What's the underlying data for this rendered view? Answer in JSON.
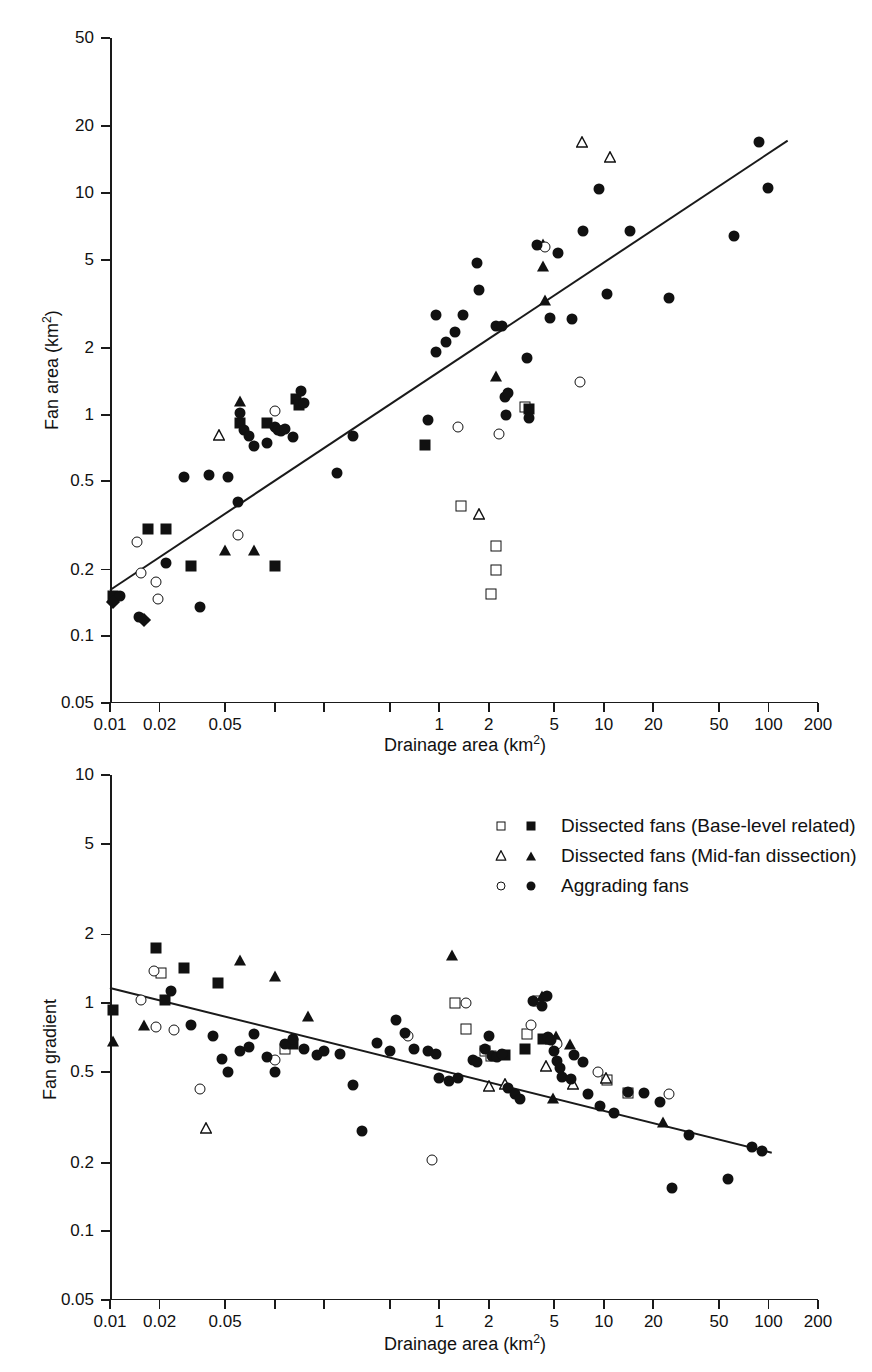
{
  "figure": {
    "background": "#ffffff",
    "ink_color": "#111111"
  },
  "chart_data": [
    {
      "id": "top-panel",
      "type": "scatter",
      "title": "",
      "xlabel": "Drainage area (km2)",
      "xlabel_base": "Drainage area (km",
      "xlabel_sup": "2",
      "xlabel_tail": ")",
      "ylabel": "Fan area (km2)",
      "ylabel_base": "Fan area (km",
      "ylabel_sup": "2",
      "ylabel_tail": ")",
      "xscale": "log",
      "yscale": "log",
      "xlim": [
        0.01,
        200
      ],
      "ylim": [
        0.05,
        50
      ],
      "grid": false,
      "xticks": [
        0.01,
        0.02,
        0.05,
        0.1,
        0.2,
        0.5,
        1,
        2,
        5,
        10,
        20,
        50,
        100,
        200
      ],
      "xticklabels": [
        "0.01",
        "0.02",
        "0.05",
        "1",
        "2",
        "5",
        "10",
        "20",
        "50",
        "100",
        "200"
      ],
      "xticklabel_values": [
        0.01,
        0.02,
        0.05,
        0.1,
        0.2,
        0.5,
        1,
        2,
        5,
        10,
        20,
        50,
        100,
        200
      ],
      "xticklabels_shown": [
        "0.01",
        "0.02",
        "0.05",
        "",
        "",
        "",
        "1",
        "2",
        "5",
        "10",
        "20",
        "50",
        "100",
        "200"
      ],
      "yticks": [
        0.05,
        0.1,
        0.2,
        0.5,
        1,
        2,
        5,
        10,
        20,
        50
      ],
      "yticklabels": [
        "0.05",
        "0.1",
        "0.2",
        "0.5",
        "1",
        "2",
        "5",
        "10",
        "20",
        "50"
      ],
      "fit_line": {
        "x0": 0.01,
        "y0": 0.162,
        "x1": 130.0,
        "y1": 17.2
      },
      "series": [
        {
          "name": "Dissected fans (Base-level related) open",
          "marker": "square-open",
          "points": [
            [
              1.35,
              0.385
            ],
            [
              2.2,
              0.255
            ],
            [
              2.2,
              0.2
            ],
            [
              2.05,
              0.155
            ],
            [
              3.3,
              1.08
            ]
          ]
        },
        {
          "name": "Dissected fans (Base-level related) filled",
          "marker": "square-filled",
          "points": [
            [
              0.0105,
              0.152
            ],
            [
              0.017,
              0.305
            ],
            [
              0.022,
              0.305
            ],
            [
              0.031,
              0.208
            ],
            [
              0.062,
              0.92
            ],
            [
              0.09,
              0.92
            ],
            [
              0.1,
              0.208
            ],
            [
              0.135,
              1.18
            ],
            [
              0.14,
              1.1
            ],
            [
              0.82,
              0.73
            ],
            [
              3.5,
              1.06
            ]
          ]
        },
        {
          "name": "Dissected fans (Mid-fan dissection) open",
          "marker": "triangle-open",
          "points": [
            [
              0.042,
              0.86
            ],
            [
              1.6,
              0.38
            ],
            [
              6.8,
              18.0
            ],
            [
              10.0,
              15.5
            ]
          ]
        },
        {
          "name": "Dissected fans (Mid-fan dissection) filled",
          "marker": "triangle-filled",
          "points": [
            [
              0.05,
              0.245
            ],
            [
              0.075,
              0.245
            ],
            [
              0.062,
              1.15
            ],
            [
              2.2,
              1.5
            ],
            [
              4.3,
              5.9
            ],
            [
              4.3,
              4.7
            ],
            [
              4.4,
              3.3
            ]
          ]
        },
        {
          "name": "Aggrading fans open",
          "marker": "circle-open",
          "points": [
            [
              0.0145,
              0.265
            ],
            [
              0.0155,
              0.193
            ],
            [
              0.019,
              0.175
            ],
            [
              0.0195,
              0.148
            ],
            [
              0.06,
              0.285
            ],
            [
              0.1,
              1.04
            ],
            [
              1.3,
              0.88
            ],
            [
              2.3,
              0.82
            ],
            [
              4.4,
              5.7
            ],
            [
              7.2,
              1.4
            ]
          ]
        },
        {
          "name": "Aggrading fans filled",
          "marker": "circle-filled",
          "points": [
            [
              0.0115,
              0.152
            ],
            [
              0.015,
              0.122
            ],
            [
              0.022,
              0.215
            ],
            [
              0.035,
              0.135
            ],
            [
              0.028,
              0.525
            ],
            [
              0.04,
              0.535
            ],
            [
              0.052,
              0.525
            ],
            [
              0.06,
              0.405
            ],
            [
              0.062,
              1.02
            ],
            [
              0.065,
              0.85
            ],
            [
              0.07,
              0.8
            ],
            [
              0.075,
              0.72
            ],
            [
              0.09,
              0.745
            ],
            [
              0.1,
              0.88
            ],
            [
              0.105,
              0.85
            ],
            [
              0.11,
              0.84
            ],
            [
              0.115,
              0.86
            ],
            [
              0.13,
              0.79
            ],
            [
              0.145,
              1.28
            ],
            [
              0.15,
              1.13
            ],
            [
              0.24,
              0.545
            ],
            [
              0.3,
              0.8
            ],
            [
              0.85,
              0.95
            ],
            [
              0.95,
              2.82
            ],
            [
              0.95,
              1.92
            ],
            [
              1.1,
              2.12
            ],
            [
              1.25,
              2.35
            ],
            [
              1.4,
              2.82
            ],
            [
              1.7,
              4.85
            ],
            [
              1.75,
              3.65
            ],
            [
              2.2,
              2.5
            ],
            [
              2.4,
              2.5
            ],
            [
              2.5,
              1.2
            ],
            [
              2.55,
              1.0
            ],
            [
              2.6,
              1.25
            ],
            [
              3.4,
              1.8
            ],
            [
              3.5,
              0.97
            ],
            [
              3.9,
              5.8
            ],
            [
              4.7,
              2.72
            ],
            [
              5.3,
              5.35
            ],
            [
              6.4,
              2.7
            ],
            [
              7.5,
              6.7
            ],
            [
              9.3,
              10.4
            ],
            [
              10.5,
              3.5
            ],
            [
              14.5,
              6.7
            ],
            [
              25.0,
              3.35
            ],
            [
              62.0,
              6.4
            ],
            [
              88.0,
              17.0
            ],
            [
              100.0,
              10.5
            ]
          ]
        },
        {
          "name": "Diamond markers",
          "marker": "diamond-filled",
          "points": [
            [
              0.0105,
              0.143
            ],
            [
              0.016,
              0.118
            ]
          ]
        }
      ]
    },
    {
      "id": "bottom-panel",
      "type": "scatter",
      "title": "",
      "xlabel": "Drainage area (km2)",
      "xlabel_base": "Drainage area (km",
      "xlabel_sup": "2",
      "xlabel_tail": ")",
      "ylabel": "Fan gradient",
      "xscale": "log",
      "yscale": "log",
      "xlim": [
        0.01,
        200
      ],
      "ylim": [
        0.05,
        10
      ],
      "grid": false,
      "xticks": [
        0.01,
        0.02,
        0.05,
        0.1,
        0.2,
        0.5,
        1,
        2,
        5,
        10,
        20,
        50,
        100,
        200
      ],
      "xticklabels_shown": [
        "0.01",
        "0.02",
        "0.05",
        "",
        "",
        "",
        "1",
        "2",
        "5",
        "10",
        "20",
        "50",
        "100",
        "200"
      ],
      "yticks": [
        0.05,
        0.1,
        0.2,
        0.5,
        1,
        2,
        5,
        10
      ],
      "yticklabels": [
        "0.05",
        "0.1",
        "0.2",
        "0.5",
        "1",
        "2",
        "5",
        "10"
      ],
      "fit_line": {
        "x0": 0.01,
        "y0": 1.17,
        "x1": 105.0,
        "y1": 0.222
      },
      "series": [
        {
          "name": "Dissected fans (Base-level related) open",
          "marker": "square-open",
          "points": [
            [
              0.0205,
              1.36
            ],
            [
              0.115,
              0.63
            ],
            [
              1.25,
              1.0
            ],
            [
              1.45,
              0.77
            ],
            [
              1.9,
              0.62
            ],
            [
              2.05,
              0.585
            ],
            [
              3.4,
              0.735
            ],
            [
              4.0,
              1.02
            ],
            [
              10.5,
              0.46
            ],
            [
              14.0,
              0.405
            ]
          ]
        },
        {
          "name": "Dissected fans (Base-level related) filled",
          "marker": "square-filled",
          "points": [
            [
              0.0105,
              0.935
            ],
            [
              0.019,
              1.75
            ],
            [
              0.0215,
              1.03
            ],
            [
              0.028,
              1.43
            ],
            [
              0.045,
              1.22
            ],
            [
              0.13,
              0.66
            ],
            [
              2.5,
              0.59
            ],
            [
              3.3,
              0.63
            ],
            [
              4.3,
              0.7
            ]
          ]
        },
        {
          "name": "Dissected fans (Mid-fan dissection) open",
          "marker": "triangle-open",
          "points": [
            [
              0.035,
              0.3
            ],
            [
              1.85,
              0.46
            ],
            [
              2.3,
              0.47
            ],
            [
              4.1,
              0.565
            ],
            [
              6.0,
              0.47
            ],
            [
              9.5,
              0.5
            ]
          ]
        },
        {
          "name": "Dissected fans (Mid-fan dissection) filled",
          "marker": "triangle-filled",
          "points": [
            [
              0.0105,
              0.68
            ],
            [
              0.016,
              0.8
            ],
            [
              0.062,
              1.55
            ],
            [
              0.1,
              1.32
            ],
            [
              0.16,
              0.88
            ],
            [
              1.2,
              1.62
            ],
            [
              4.2,
              1.07
            ],
            [
              4.8,
              0.7
            ],
            [
              4.9,
              0.385
            ],
            [
              5.1,
              0.72
            ],
            [
              6.2,
              0.66
            ],
            [
              23.0,
              0.3
            ]
          ]
        },
        {
          "name": "Aggrading fans open",
          "marker": "circle-open",
          "points": [
            [
              0.0155,
              1.03
            ],
            [
              0.0185,
              1.38
            ],
            [
              0.019,
              0.79
            ],
            [
              0.0245,
              0.76
            ],
            [
              0.035,
              0.42
            ],
            [
              0.1,
              0.565
            ],
            [
              0.65,
              0.72
            ],
            [
              0.9,
              0.205
            ],
            [
              1.45,
              1.0
            ],
            [
              3.6,
              0.8
            ],
            [
              5.2,
              0.66
            ],
            [
              9.2,
              0.5
            ],
            [
              25.0,
              0.4
            ]
          ]
        },
        {
          "name": "Aggrading fans filled",
          "marker": "circle-filled",
          "points": [
            [
              0.0235,
              1.13
            ],
            [
              0.031,
              0.8
            ],
            [
              0.042,
              0.72
            ],
            [
              0.048,
              0.57
            ],
            [
              0.052,
              0.5
            ],
            [
              0.062,
              0.62
            ],
            [
              0.07,
              0.64
            ],
            [
              0.075,
              0.73
            ],
            [
              0.09,
              0.58
            ],
            [
              0.1,
              0.5
            ],
            [
              0.115,
              0.66
            ],
            [
              0.13,
              0.7
            ],
            [
              0.15,
              0.63
            ],
            [
              0.18,
              0.59
            ],
            [
              0.2,
              0.62
            ],
            [
              0.25,
              0.6
            ],
            [
              0.3,
              0.44
            ],
            [
              0.34,
              0.275
            ],
            [
              0.42,
              0.67
            ],
            [
              0.5,
              0.62
            ],
            [
              0.55,
              0.84
            ],
            [
              0.62,
              0.74
            ],
            [
              0.7,
              0.63
            ],
            [
              0.85,
              0.62
            ],
            [
              0.95,
              0.6
            ],
            [
              1.0,
              0.47
            ],
            [
              1.15,
              0.455
            ],
            [
              1.3,
              0.47
            ],
            [
              1.6,
              0.565
            ],
            [
              1.7,
              0.55
            ],
            [
              1.9,
              0.63
            ],
            [
              2.0,
              0.72
            ],
            [
              2.1,
              0.585
            ],
            [
              2.25,
              0.58
            ],
            [
              2.4,
              0.6
            ],
            [
              2.6,
              0.425
            ],
            [
              2.9,
              0.4
            ],
            [
              3.1,
              0.38
            ],
            [
              3.7,
              1.02
            ],
            [
              4.2,
              0.97
            ],
            [
              4.5,
              1.07
            ],
            [
              4.6,
              0.71
            ],
            [
              4.8,
              0.69
            ],
            [
              5.0,
              0.62
            ],
            [
              5.2,
              0.56
            ],
            [
              5.4,
              0.52
            ],
            [
              5.6,
              0.475
            ],
            [
              6.3,
              0.465
            ],
            [
              6.6,
              0.59
            ],
            [
              7.5,
              0.55
            ],
            [
              8.0,
              0.4
            ],
            [
              9.5,
              0.355
            ],
            [
              11.5,
              0.33
            ],
            [
              14.0,
              0.41
            ],
            [
              17.5,
              0.405
            ],
            [
              22.0,
              0.37
            ],
            [
              26.0,
              0.155
            ],
            [
              33.0,
              0.265
            ],
            [
              57.0,
              0.17
            ],
            [
              80.0,
              0.235
            ],
            [
              92.0,
              0.225
            ]
          ]
        }
      ]
    }
  ],
  "legend": {
    "position": "upper-right-of-bottom-panel",
    "entries": [
      {
        "open_marker": "square-open-icon",
        "filled_marker": "square-filled-icon",
        "label": "Dissected fans (Base-level related)"
      },
      {
        "open_marker": "triangle-open-icon",
        "filled_marker": "triangle-filled-icon",
        "label": "Dissected fans (Mid-fan dissection)"
      },
      {
        "open_marker": "circle-open-icon",
        "filled_marker": "circle-filled-icon",
        "label": "Aggrading fans"
      }
    ]
  }
}
